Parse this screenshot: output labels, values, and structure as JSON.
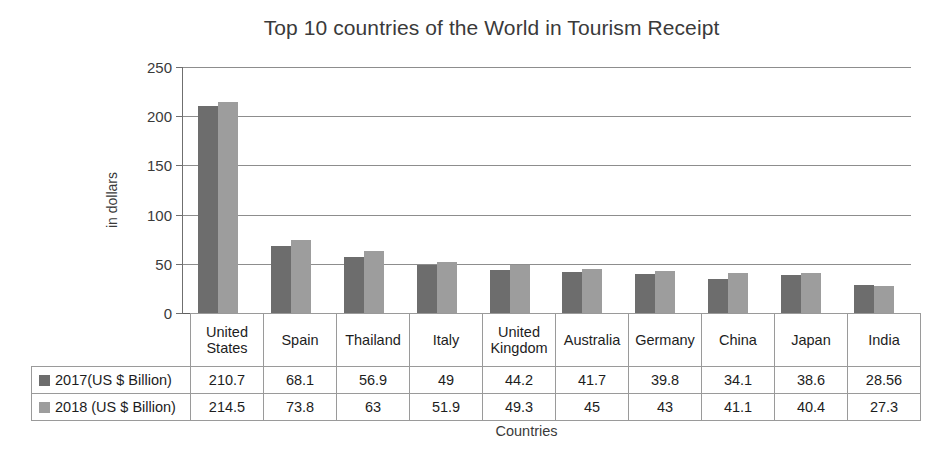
{
  "chart_data": {
    "type": "bar",
    "title": "Top 10 countries of the World in Tourism Receipt",
    "xlabel": "Countries",
    "ylabel": "in dollars",
    "ylim": [
      0,
      250
    ],
    "yticks": [
      0,
      50,
      100,
      150,
      200,
      250
    ],
    "grid": true,
    "legend_position": "table-left",
    "categories": [
      "United States",
      "Spain",
      "Thailand",
      "Italy",
      "United Kingdom",
      "Australia",
      "Germany",
      "China",
      "Japan",
      "India"
    ],
    "series": [
      {
        "name": "2017(US $ Billion)",
        "color": "#6d6d6d",
        "values": [
          210.7,
          68.1,
          56.9,
          49,
          44.2,
          41.7,
          39.8,
          34.1,
          38.6,
          28.56
        ],
        "value_labels": [
          "210.7",
          "68.1",
          "56.9",
          "49",
          "44.2",
          "41.7",
          "39.8",
          "34.1",
          "38.6",
          "28.56"
        ]
      },
      {
        "name": "2018 (US $ Billion)",
        "color": "#9d9d9d",
        "values": [
          214.5,
          73.8,
          63,
          51.9,
          49.3,
          45,
          43,
          41.1,
          40.4,
          27.3
        ],
        "value_labels": [
          "214.5",
          "73.8",
          "63",
          "51.9",
          "49.3",
          "45",
          "43",
          "41.1",
          "40.4",
          "27.3"
        ]
      }
    ]
  }
}
